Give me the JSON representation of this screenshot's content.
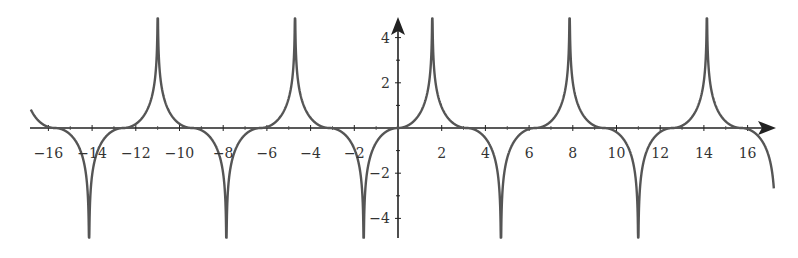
{
  "chart_data": {
    "type": "line",
    "title": "",
    "xlabel": "",
    "ylabel": "",
    "function_description": "y = -sign(sin x) * ln|cos x| (periodic curve with cusps at x = pi/2 + k*pi)",
    "xlim": [
      -16.8,
      17.2
    ],
    "ylim": [
      -5,
      5
    ],
    "grid": false,
    "legend": null,
    "x_ticks": [
      -16,
      -14,
      -12,
      -10,
      -8,
      -6,
      -4,
      -2,
      2,
      4,
      6,
      8,
      10,
      12,
      14,
      16
    ],
    "x_tick_labels": [
      "−16",
      "−14",
      "−12",
      "−10",
      "−8",
      "−6",
      "−4",
      "−2",
      "2",
      "4",
      "6",
      "8",
      "10",
      "12",
      "14",
      "16"
    ],
    "y_ticks": [
      -4,
      -2,
      2,
      4
    ],
    "y_tick_labels": [
      "−4",
      "−2",
      "2",
      "4"
    ],
    "zeros": [
      -15.71,
      -12.57,
      -9.42,
      -6.28,
      -3.14,
      0,
      3.14,
      6.28,
      9.42,
      12.57,
      15.71
    ],
    "cusps": [
      {
        "x": -14.14,
        "direction": "down"
      },
      {
        "x": -10.99,
        "direction": "up"
      },
      {
        "x": -7.85,
        "direction": "down"
      },
      {
        "x": -4.71,
        "direction": "up"
      },
      {
        "x": -1.57,
        "direction": "down"
      },
      {
        "x": 1.57,
        "direction": "up"
      },
      {
        "x": 4.71,
        "direction": "down"
      },
      {
        "x": 7.85,
        "direction": "up"
      },
      {
        "x": 10.99,
        "direction": "down"
      },
      {
        "x": 14.14,
        "direction": "up"
      }
    ],
    "line_color": "#555555",
    "axis_color": "#222222"
  }
}
